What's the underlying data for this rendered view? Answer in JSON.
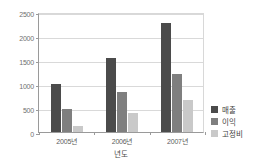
{
  "chart_data": {
    "type": "bar",
    "title": "",
    "xlabel": "년도",
    "ylabel": "",
    "categories": [
      "2005년",
      "2006년",
      "2007년"
    ],
    "series": [
      {
        "name": "매출",
        "color": "#4b4b4b",
        "values": [
          1000,
          1540,
          2270
        ]
      },
      {
        "name": "이익",
        "color": "#7f7f7f",
        "values": [
          480,
          830,
          1210
        ]
      },
      {
        "name": "고정비",
        "color": "#c9c9c9",
        "values": [
          125,
          400,
          670
        ]
      }
    ],
    "ylim": [
      0,
      2500
    ],
    "ytick_labels": [
      "0",
      "500",
      "1000",
      "1500",
      "2000",
      "2500"
    ],
    "ytick_values": [
      0,
      500,
      1000,
      1500,
      2000,
      2500
    ],
    "grid": true,
    "legend_position": "right"
  },
  "legend": {
    "items": [
      {
        "label": "매출",
        "swatch": "legend-swatch-sales"
      },
      {
        "label": "이익",
        "swatch": "legend-swatch-profit"
      },
      {
        "label": "고정비",
        "swatch": "legend-swatch-fixedcost"
      }
    ]
  },
  "top_fragment": ""
}
